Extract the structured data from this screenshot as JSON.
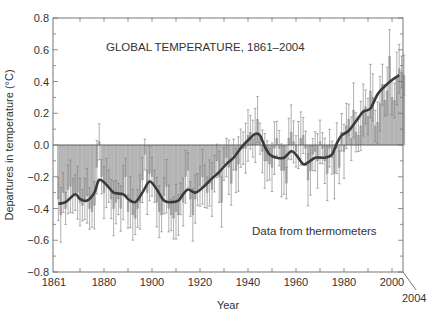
{
  "chart_data": {
    "type": "bar",
    "title": "GLOBAL TEMPERATURE, 1861–2004",
    "annotation": "Data from thermometers",
    "xlabel": "Year",
    "ylabel": "Departures in temperature (°C)",
    "xlim": [
      1859,
      2004.5
    ],
    "ylim": [
      -0.8,
      0.8
    ],
    "x_ticks": [
      1861,
      1880,
      1900,
      1920,
      1940,
      1960,
      1980,
      2000
    ],
    "x_tick_labels": [
      "1861",
      "1880",
      "1900",
      "1920",
      "1940",
      "1960",
      "1980",
      "2000"
    ],
    "x_end_label": "2004",
    "y_ticks": [
      0.8,
      0.6,
      0.4,
      0.2,
      0.0,
      -0.2,
      -0.4,
      -0.6,
      -0.8
    ],
    "y_tick_labels": [
      "0.8",
      "0.6",
      "0.4",
      "0.2",
      "0.0",
      "−0.2",
      "−0.4",
      "−0.6",
      "−0.8"
    ],
    "grid": false,
    "legend": null,
    "series": [
      {
        "name": "Annual temperature anomaly (bars with uncertainty range)",
        "kind": "bar",
        "x_start": 1861,
        "values": [
          -0.34,
          -0.44,
          -0.3,
          -0.4,
          -0.28,
          -0.26,
          -0.32,
          -0.3,
          -0.3,
          -0.36,
          -0.38,
          -0.34,
          -0.32,
          -0.4,
          -0.42,
          -0.38,
          -0.14,
          0.02,
          -0.2,
          -0.3,
          -0.24,
          -0.26,
          -0.34,
          -0.4,
          -0.36,
          -0.34,
          -0.4,
          -0.3,
          -0.2,
          -0.42,
          -0.36,
          -0.44,
          -0.46,
          -0.4,
          -0.36,
          -0.22,
          -0.06,
          -0.3,
          -0.18,
          -0.2,
          -0.26,
          -0.36,
          -0.42,
          -0.44,
          -0.32,
          -0.26,
          -0.4,
          -0.44,
          -0.46,
          -0.42,
          -0.44,
          -0.34,
          -0.36,
          -0.2,
          -0.16,
          -0.34,
          -0.44,
          -0.34,
          -0.28,
          -0.26,
          -0.2,
          -0.26,
          -0.3,
          -0.24,
          -0.28,
          -0.18,
          -0.1,
          -0.2,
          -0.36,
          -0.12,
          -0.08,
          -0.14,
          -0.24,
          -0.06,
          -0.16,
          -0.12,
          -0.02,
          -0.02,
          -0.02,
          0.06,
          0.08,
          0.04,
          0.06,
          0.16,
          0.04,
          -0.04,
          -0.1,
          -0.1,
          -0.12,
          -0.14,
          -0.02,
          0.04,
          -0.02,
          -0.16,
          -0.16,
          -0.24,
          0.04,
          0.08,
          0.02,
          -0.04,
          0.0,
          0.04,
          0.06,
          -0.02,
          -0.22,
          -0.16,
          -0.06,
          -0.04,
          -0.1,
          0.02,
          -0.02,
          -0.1,
          -0.18,
          -0.02,
          -0.08,
          -0.18,
          -0.02,
          -0.14,
          0.08,
          -0.04,
          0.12,
          0.16,
          0.04,
          0.22,
          0.08,
          0.06,
          0.12,
          0.22,
          0.24,
          0.18,
          0.34,
          0.3,
          0.12,
          0.14,
          0.26,
          0.38,
          0.28,
          0.34,
          0.56,
          0.3,
          0.28,
          0.42,
          0.48,
          0.46,
          0.44
        ],
        "uncertainty": 0.15
      },
      {
        "name": "Smoothed curve",
        "kind": "line",
        "points": [
          [
            1861,
            -0.37
          ],
          [
            1864,
            -0.36
          ],
          [
            1868,
            -0.31
          ],
          [
            1870,
            -0.34
          ],
          [
            1873,
            -0.35
          ],
          [
            1876,
            -0.3
          ],
          [
            1878,
            -0.22
          ],
          [
            1881,
            -0.25
          ],
          [
            1884,
            -0.3
          ],
          [
            1888,
            -0.31
          ],
          [
            1890,
            -0.34
          ],
          [
            1893,
            -0.36
          ],
          [
            1896,
            -0.3
          ],
          [
            1899,
            -0.23
          ],
          [
            1902,
            -0.28
          ],
          [
            1905,
            -0.35
          ],
          [
            1908,
            -0.36
          ],
          [
            1911,
            -0.35
          ],
          [
            1913,
            -0.31
          ],
          [
            1915,
            -0.28
          ],
          [
            1918,
            -0.3
          ],
          [
            1921,
            -0.27
          ],
          [
            1925,
            -0.21
          ],
          [
            1928,
            -0.17
          ],
          [
            1931,
            -0.12
          ],
          [
            1934,
            -0.08
          ],
          [
            1937,
            -0.02
          ],
          [
            1940,
            0.03
          ],
          [
            1943,
            0.07
          ],
          [
            1945,
            0.06
          ],
          [
            1947,
            -0.01
          ],
          [
            1949,
            -0.06
          ],
          [
            1952,
            -0.08
          ],
          [
            1955,
            -0.08
          ],
          [
            1958,
            -0.04
          ],
          [
            1960,
            -0.06
          ],
          [
            1963,
            -0.12
          ],
          [
            1965,
            -0.11
          ],
          [
            1968,
            -0.08
          ],
          [
            1972,
            -0.08
          ],
          [
            1975,
            -0.06
          ],
          [
            1977,
            0.01
          ],
          [
            1979,
            0.06
          ],
          [
            1982,
            0.09
          ],
          [
            1985,
            0.15
          ],
          [
            1988,
            0.21
          ],
          [
            1991,
            0.23
          ],
          [
            1994,
            0.32
          ],
          [
            1997,
            0.37
          ],
          [
            2000,
            0.41
          ],
          [
            2003,
            0.44
          ]
        ]
      }
    ]
  }
}
